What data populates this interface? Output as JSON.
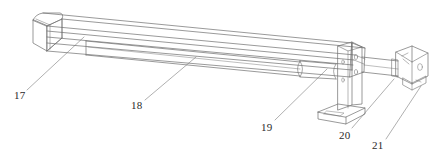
{
  "figure": {
    "type": "patent-line-drawing",
    "view": "isometric",
    "background_color": "#ffffff",
    "line_color": "#6e6e6e",
    "label_color": "#2a2a2a"
  },
  "callouts": [
    {
      "id": "17",
      "label": "17",
      "x": 14,
      "y": 90,
      "leader": {
        "x1": 27,
        "y1": 90,
        "x2": 84,
        "y2": 37
      }
    },
    {
      "id": "18",
      "label": "18",
      "x": 131,
      "y": 100,
      "leader": {
        "x1": 145,
        "y1": 100,
        "x2": 196,
        "y2": 57
      }
    },
    {
      "id": "19",
      "label": "19",
      "x": 261,
      "y": 122,
      "leader": {
        "x1": 275,
        "y1": 120,
        "x2": 327,
        "y2": 69
      }
    },
    {
      "id": "20",
      "label": "20",
      "x": 339,
      "y": 130,
      "leader": {
        "x1": 352,
        "y1": 128,
        "x2": 394,
        "y2": 79
      }
    },
    {
      "id": "21",
      "label": "21",
      "x": 372,
      "y": 140,
      "leader": {
        "x1": 386,
        "y1": 139,
        "x2": 421,
        "y2": 86
      }
    }
  ],
  "parts": {
    "beam": "main-rail-beam",
    "end_cap": "left-end-cap",
    "guide_rod": "lower-guide-rod",
    "bushing": "rod-bushing-sleeve",
    "bracket": "vertical-l-bracket",
    "base_plate": "bracket-base-plate",
    "shaft": "drive-shaft",
    "end_block": "right-end-mounting-block"
  }
}
